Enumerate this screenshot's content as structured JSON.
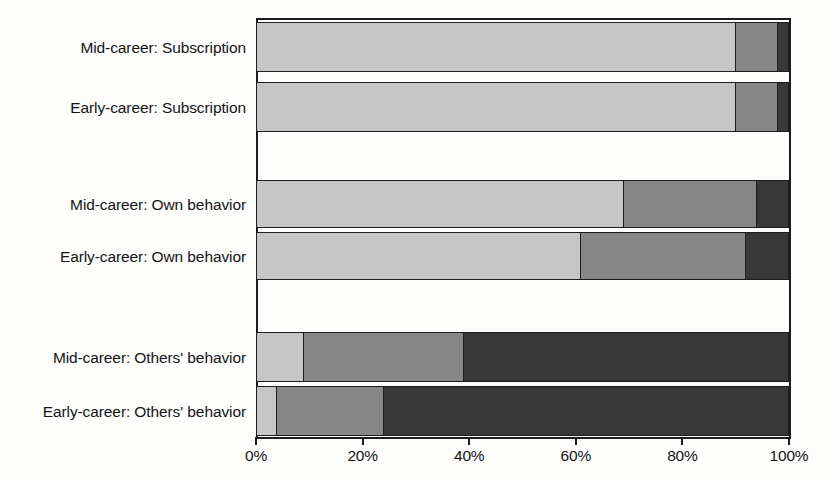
{
  "chart_data": {
    "type": "bar",
    "orientation": "horizontal",
    "stacked": true,
    "normalized": true,
    "title": "",
    "subtitle": "",
    "xlabel": "",
    "ylabel": "",
    "xlim": [
      0,
      100
    ],
    "xticks": [
      0,
      20,
      40,
      60,
      80,
      100
    ],
    "xticklabels": [
      "0%",
      "20%",
      "40%",
      "60%",
      "80%",
      "100%"
    ],
    "grid": false,
    "legend": "none",
    "categories": [
      "Mid-career: Subscription",
      "Early-career: Subscription",
      "Mid-career: Own behavior",
      "Early-career: Own behavior",
      "Mid-career: Others' behavior",
      "Early-career: Others' behavior"
    ],
    "series": [
      {
        "name": "Segment 1",
        "color": "#c6c6c6",
        "values": [
          90,
          90,
          69,
          61,
          9,
          4
        ]
      },
      {
        "name": "Segment 2",
        "color": "#878787",
        "values": [
          8,
          8,
          25,
          31,
          30,
          20
        ]
      },
      {
        "name": "Segment 3",
        "color": "#383838",
        "values": [
          2,
          2,
          6,
          8,
          61,
          76
        ]
      }
    ],
    "group_gaps_after": [
      1,
      3
    ]
  },
  "axis": {
    "ticks": [
      {
        "label": "0%",
        "value": 0
      },
      {
        "label": "20%",
        "value": 20
      },
      {
        "label": "40%",
        "value": 40
      },
      {
        "label": "60%",
        "value": 60
      },
      {
        "label": "80%",
        "value": 80
      },
      {
        "label": "100%",
        "value": 100
      }
    ]
  },
  "colors": {
    "segment_light": "#c6c6c6",
    "segment_medium": "#878787",
    "segment_dark": "#383838",
    "outline": "#1d1d1d",
    "background": "#fdfdfc",
    "text": "#141414"
  },
  "rows": [
    {
      "label": "Mid-career: Subscription",
      "top": 22,
      "height": 50,
      "values": [
        90,
        8,
        2
      ]
    },
    {
      "label": "Early-career: Subscription",
      "top": 82,
      "height": 50,
      "values": [
        90,
        8,
        2
      ]
    },
    {
      "label": "Mid-career: Own behavior",
      "top": 180,
      "height": 48,
      "values": [
        69,
        25,
        6
      ]
    },
    {
      "label": "Early-career: Own behavior",
      "top": 232,
      "height": 48,
      "values": [
        61,
        31,
        8
      ]
    },
    {
      "label": "Mid-career: Others' behavior",
      "top": 332,
      "height": 50,
      "values": [
        9,
        30,
        61
      ]
    },
    {
      "label": "Early-career: Others' behavior",
      "top": 386,
      "height": 50,
      "values": [
        4,
        20,
        76
      ]
    }
  ]
}
